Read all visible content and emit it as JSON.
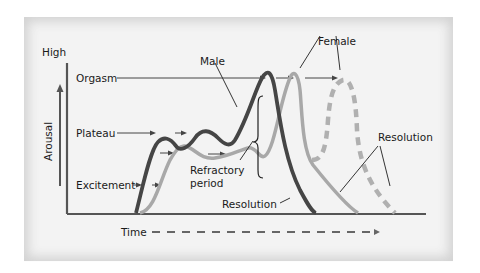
{
  "diagram": {
    "y_axis": {
      "top_label": "High",
      "axis_label": "Arousal"
    },
    "x_axis": {
      "label": "Time"
    },
    "phase_labels": [
      "Orgasm",
      "Plateau",
      "Excitement"
    ],
    "curve_labels": {
      "male": "Male",
      "female": "Female",
      "refractory": [
        "Refractory",
        "period"
      ],
      "resolution_male": "Resolution",
      "resolution_female": "Resolution"
    },
    "colors": {
      "background": "#f3f3f3",
      "male_curve": "#454545",
      "female_curve": "#a8a8a8",
      "axis": "#555555",
      "text": "#1a1a1a"
    }
  }
}
